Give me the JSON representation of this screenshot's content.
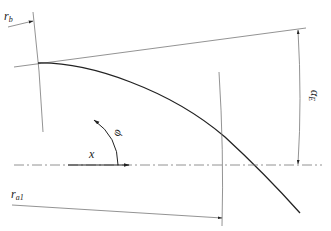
{
  "diagram": {
    "type": "geometric construction",
    "labels": {
      "r_b": {
        "main": "r",
        "sub": "b"
      },
      "alpha_E": {
        "main": "α",
        "sub": "E"
      },
      "phi": "φ",
      "x": "x",
      "r_a1": {
        "main": "r",
        "sub": "a1"
      }
    },
    "elements": [
      "base-circle-arc",
      "tangent-line",
      "involute-curve",
      "tip-circle-arc",
      "center-line",
      "x-axis-arrow",
      "phi-rotation-arrow",
      "alpha-E-dimension",
      "r-b-dimension",
      "r-a1-dimension"
    ],
    "colors": {
      "stroke": "#555555",
      "curve": "#222222",
      "text": "#222222"
    }
  }
}
